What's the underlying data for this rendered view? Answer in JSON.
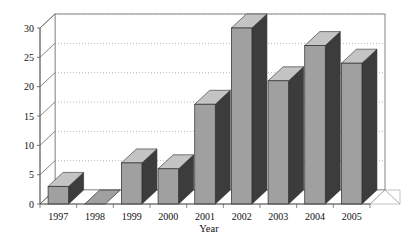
{
  "chart_data": {
    "type": "bar",
    "title": "",
    "subtitle": "",
    "xlabel": "Year",
    "ylabel": "",
    "categories": [
      "1997",
      "1998",
      "1999",
      "2000",
      "2001",
      "2002",
      "2003",
      "2004",
      "2005"
    ],
    "values": [
      3,
      0,
      7,
      6,
      17,
      30,
      21,
      27,
      24
    ],
    "series": [
      {
        "name": "",
        "values": [
          3,
          0,
          7,
          6,
          17,
          30,
          21,
          27,
          24
        ]
      }
    ],
    "ylim": [
      0,
      30
    ],
    "yticks": [
      0,
      5,
      10,
      15,
      20,
      25,
      30
    ],
    "ytick_labels": [
      "0",
      "5",
      "10",
      "15",
      "20",
      "25",
      "30"
    ],
    "grid": true,
    "grid_style": "dotted-horizontal",
    "legend": "none",
    "style_3d": true,
    "colors": {
      "bar_front": "#a0a0a0",
      "bar_side": "#3c3c3c",
      "bar_top": "#c4c4c4",
      "bar_outline": "#2b2b2b",
      "grid": "#9a9a9a",
      "axis": "#555555",
      "floor": "#ffffff",
      "background": "#ffffff",
      "text": "#111111"
    }
  }
}
